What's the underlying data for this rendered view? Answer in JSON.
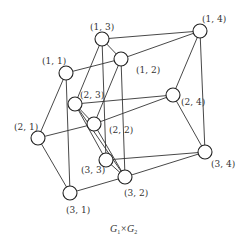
{
  "diagram": {
    "caption": {
      "base1": "G",
      "sub1": "1",
      "times": "×",
      "base2": "G",
      "sub2": "2"
    },
    "nodes": [
      {
        "id": "1,1",
        "label": "(1, 1)",
        "x": 66,
        "y": 73,
        "lx": 42,
        "ly": 64
      },
      {
        "id": "1,3",
        "label": "(1, 3)",
        "x": 102,
        "y": 39,
        "lx": 90,
        "ly": 30
      },
      {
        "id": "1,2",
        "label": "(1, 2)",
        "x": 121,
        "y": 59,
        "lx": 136,
        "ly": 73
      },
      {
        "id": "1,4",
        "label": "(1, 4)",
        "x": 200,
        "y": 31,
        "lx": 202,
        "ly": 22
      },
      {
        "id": "2,3",
        "label": "(2, 3)",
        "x": 75,
        "y": 104,
        "lx": 80,
        "ly": 98
      },
      {
        "id": "2,2",
        "label": "(2, 2)",
        "x": 94,
        "y": 124,
        "lx": 109,
        "ly": 133
      },
      {
        "id": "2,4",
        "label": "(2, 4)",
        "x": 173,
        "y": 95,
        "lx": 181,
        "ly": 105
      },
      {
        "id": "2,1",
        "label": "(2, 1)",
        "x": 38,
        "y": 138,
        "lx": 14,
        "ly": 130
      },
      {
        "id": "3,3",
        "label": "(3, 3)",
        "x": 106,
        "y": 160,
        "lx": 81,
        "ly": 173
      },
      {
        "id": "3,2",
        "label": "(3, 2)",
        "x": 125,
        "y": 177,
        "lx": 124,
        "ly": 196
      },
      {
        "id": "3,4",
        "label": "(3, 4)",
        "x": 205,
        "y": 152,
        "lx": 211,
        "ly": 167
      },
      {
        "id": "3,1",
        "label": "(3, 1)",
        "x": 70,
        "y": 193,
        "lx": 66,
        "ly": 213
      }
    ],
    "edges": [
      [
        "1,1",
        "1,2"
      ],
      [
        "1,3",
        "1,2"
      ],
      [
        "1,3",
        "1,4"
      ],
      [
        "1,2",
        "1,4"
      ],
      [
        "2,1",
        "2,2"
      ],
      [
        "2,3",
        "2,2"
      ],
      [
        "2,3",
        "2,4"
      ],
      [
        "2,2",
        "2,4"
      ],
      [
        "3,1",
        "3,2"
      ],
      [
        "3,3",
        "3,2"
      ],
      [
        "3,3",
        "3,4"
      ],
      [
        "3,2",
        "3,4"
      ],
      [
        "1,1",
        "2,1"
      ],
      [
        "2,1",
        "3,1"
      ],
      [
        "1,1",
        "3,1"
      ],
      [
        "1,3",
        "2,3"
      ],
      [
        "2,3",
        "3,3"
      ],
      [
        "1,3",
        "3,3"
      ],
      [
        "1,2",
        "2,2"
      ],
      [
        "2,2",
        "3,2"
      ],
      [
        "1,2",
        "3,2"
      ],
      [
        "1,4",
        "2,4"
      ],
      [
        "2,4",
        "3,4"
      ],
      [
        "1,4",
        "3,4"
      ],
      [
        "2,3",
        "3,2"
      ]
    ]
  }
}
